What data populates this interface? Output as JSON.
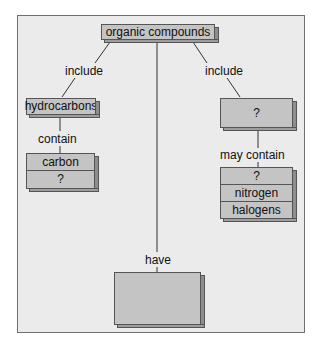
{
  "diagram": {
    "type": "concept-map",
    "root": {
      "label": "organic compounds"
    },
    "links": {
      "left": "include",
      "left_sub": "contain",
      "right": "include",
      "right_sub": "may contain",
      "center": "have"
    },
    "nodes": {
      "hydrocarbons": {
        "label": "hydrocarbons"
      },
      "hydrocarbons_contain": [
        "carbon",
        "?"
      ],
      "right_group": {
        "label": "?"
      },
      "right_contains": [
        "?",
        "nitrogen",
        "halogens"
      ],
      "center_have": [
        "straight carbon chains",
        "?",
        "?"
      ]
    },
    "colors": {
      "background": "#ebebeb",
      "box_face": "#c4c4c4",
      "box_side": "#8e8e8e",
      "border": "#555555"
    }
  }
}
